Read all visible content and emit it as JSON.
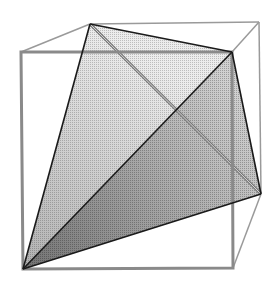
{
  "diagram": {
    "colors": {
      "background": "#ffffff",
      "cube_edge": "#8a8a8a",
      "cube_back_edge": "#9a9a9a",
      "tetra_edge": "#1a1a1a",
      "hidden_tetra_edge": "#7a7a7a",
      "face_light": "#e6e6e6",
      "face_dark": "#9c9c9c"
    },
    "cube": {
      "front_face": [
        [
          21,
          52
        ],
        [
          232,
          52
        ],
        [
          233,
          268
        ],
        [
          23,
          269
        ]
      ],
      "back_vertices": {
        "top_left": [
          90,
          24
        ],
        "top_right": [
          259,
          22
        ],
        "bottom_right": [
          261,
          194
        ]
      }
    },
    "tetrahedron": {
      "vertices": {
        "A": [
          90,
          24
        ],
        "B": [
          232,
          52
        ],
        "C": [
          261,
          194
        ],
        "D": [
          23,
          269
        ]
      },
      "visible_edges": [
        "AB",
        "AD",
        "BC",
        "BD",
        "CD"
      ],
      "hidden_edge": "AC"
    }
  }
}
